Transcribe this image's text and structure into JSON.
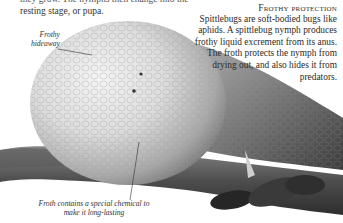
{
  "intro": {
    "line_cut": "they grow. The nymphs then change into the",
    "line_2": "resting stage, or pupa."
  },
  "sidebar": {
    "heading": "Frothy protection",
    "body": "Spittlebugs are soft-bodied bugs like aphids. A spittlebug nymph produces frothy liquid excrement from its anus. The froth protects the nymph from drying out, and also hides it from predators."
  },
  "labels": {
    "hideaway": "Frothy hideaway",
    "chemical": "Froth contains a special chemical to make it long-lasting"
  },
  "photo": {
    "subject": "spittlebug froth on plant stem",
    "tone": "grayscale"
  }
}
